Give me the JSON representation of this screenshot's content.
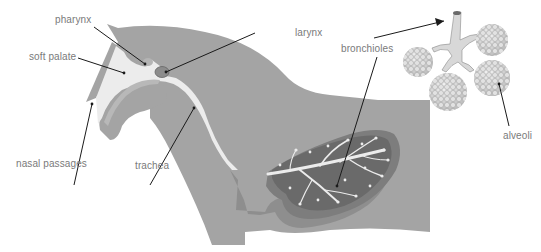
{
  "diagram": {
    "colors": {
      "body": "#a4a4a4",
      "body_dark": "#8e8e8e",
      "lung_outer": "#7d7d7d",
      "lung_inner": "#6a6a6a",
      "airway": "#ececec",
      "line": "#1a1a1a",
      "label_text": "#7a7a7a"
    },
    "labels": {
      "pharynx": "pharynx",
      "soft_palate": "soft palate",
      "larynx": "larynx",
      "bronchioles": "bronchioles",
      "alveoli": "alveoli",
      "nasal_passages": "nasal passages",
      "trachea": "trachea"
    }
  }
}
